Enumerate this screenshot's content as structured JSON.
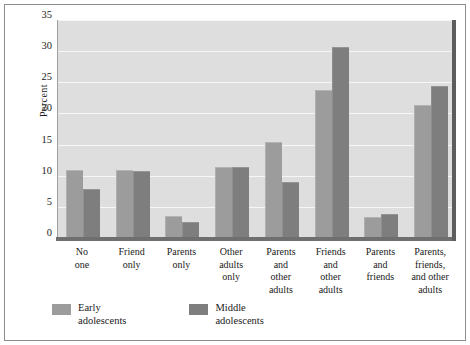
{
  "chart_data": {
    "type": "bar",
    "title": "",
    "xlabel": "",
    "ylabel": "Percent",
    "ylim": [
      0,
      35
    ],
    "yticks": [
      0,
      5,
      10,
      15,
      20,
      25,
      30,
      35
    ],
    "grid": true,
    "legend_position": "bottom-left",
    "categories": [
      "No\none",
      "Friend\nonly",
      "Parents\nonly",
      "Other\nadults\nonly",
      "Parents\nand\nother\nadults",
      "Friends\nand\nother\nadults",
      "Parents\nand\nfriends",
      "Parents,\nfriends,\nand other\nadults"
    ],
    "series": [
      {
        "name": "Early\nadolescents",
        "color": "#9c9c9c",
        "values": [
          10.8,
          10.8,
          3.4,
          11.2,
          15.3,
          23.6,
          3.2,
          21.2
        ]
      },
      {
        "name": "Middle\nadolescents",
        "color": "#7e7e7e",
        "values": [
          7.7,
          10.6,
          2.4,
          11.3,
          8.9,
          30.5,
          3.7,
          24.3
        ]
      }
    ]
  }
}
